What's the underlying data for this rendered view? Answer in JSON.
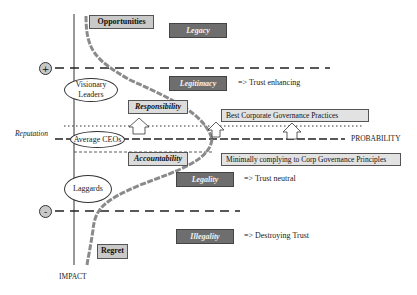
{
  "diagram": {
    "axes": {
      "y_label": "IMPACT",
      "x_label": "PROBABILITY",
      "reputation_label": "Reputation"
    },
    "signs": {
      "plus": "+",
      "minus": "-"
    },
    "groups": {
      "visionary": "Visionary Leaders",
      "average": "Average CEOs",
      "laggards": "Laggards"
    },
    "light_boxes": {
      "opportunities": "Opportunities",
      "responsibility": "Responsibility",
      "accountability": "Accountability",
      "regret": "Regret"
    },
    "dark_boxes": {
      "legacy": "Legacy",
      "legitimacy": "Legitimacy",
      "legality": "Legality",
      "illegality": "Illegality"
    },
    "trust_notes": {
      "enhancing": "=> Trust enhancing",
      "neutral": "=> Trust neutral",
      "destroying": "=> Destroying Trust"
    },
    "practices": {
      "best": "Best Corporate Governance Practices",
      "minimal": "Minimally complying to Corp Governance Principles"
    },
    "colors": {
      "curve": "#8a8a8a",
      "dark_box": "#6e6e6e",
      "light_box": "#c9c9c9",
      "sign_circle": "#c8c8c8"
    }
  }
}
